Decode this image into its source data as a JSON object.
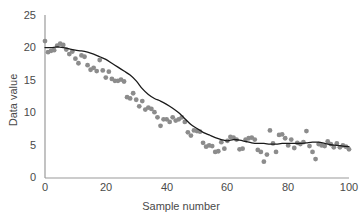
{
  "chart_data": {
    "type": "scatter",
    "title": "",
    "subtitle": "",
    "xlabel": "Sample number",
    "ylabel": "Data value",
    "xlim": [
      0,
      100
    ],
    "ylim": [
      0,
      25
    ],
    "xticks": [
      0,
      20,
      40,
      60,
      80,
      100
    ],
    "yticks": [
      0,
      5,
      10,
      15,
      20,
      25
    ],
    "grid": false,
    "legend": null,
    "colors": {
      "points": "#8c8c8c",
      "line": "#1a1a1a",
      "axis": "#9a9a9a",
      "text": "#4a4a4a",
      "background": "#ffffff"
    },
    "annotations": [],
    "series": [
      {
        "name": "Data value",
        "type": "scatter",
        "marker": "circle",
        "color": "#8c8c8c",
        "x": [
          0,
          1,
          2,
          3,
          4,
          5,
          6,
          7,
          8,
          9,
          10,
          11,
          12,
          13,
          14,
          15,
          16,
          17,
          18,
          19,
          20,
          21,
          22,
          23,
          24,
          25,
          26,
          27,
          28,
          29,
          30,
          31,
          32,
          33,
          34,
          35,
          36,
          37,
          38,
          39,
          40,
          41,
          42,
          43,
          44,
          45,
          46,
          47,
          48,
          49,
          50,
          51,
          52,
          53,
          54,
          55,
          56,
          57,
          58,
          59,
          60,
          61,
          62,
          63,
          64,
          65,
          66,
          67,
          68,
          69,
          70,
          71,
          72,
          73,
          74,
          75,
          76,
          77,
          78,
          79,
          80,
          81,
          82,
          83,
          84,
          85,
          86,
          87,
          88,
          89,
          90,
          91,
          92,
          93,
          94,
          95,
          96,
          97,
          98,
          99,
          100
        ],
        "y": [
          21.0,
          19.3,
          19.5,
          19.6,
          20.3,
          20.6,
          20.4,
          19.7,
          19.0,
          19.4,
          18.3,
          17.6,
          18.8,
          18.6,
          17.3,
          16.6,
          16.9,
          16.4,
          18.1,
          16.5,
          15.4,
          16.3,
          15.2,
          14.9,
          14.9,
          15.1,
          14.8,
          12.4,
          12.2,
          13.0,
          12.0,
          11.0,
          11.8,
          10.5,
          10.8,
          10.6,
          10.1,
          9.3,
          8.0,
          9.0,
          9.0,
          8.6,
          9.3,
          8.8,
          9.0,
          9.3,
          8.6,
          7.0,
          6.5,
          7.3,
          7.2,
          7.1,
          5.4,
          4.8,
          5.0,
          4.9,
          4.0,
          4.1,
          5.5,
          4.5,
          5.7,
          6.3,
          6.2,
          5.9,
          4.4,
          4.5,
          5.9,
          6.1,
          6.2,
          5.9,
          4.3,
          4.0,
          2.5,
          3.6,
          7.3,
          5.3,
          4.0,
          6.6,
          6.7,
          6.1,
          5.0,
          5.9,
          4.6,
          5.4,
          5.2,
          5.5,
          7.2,
          4.9,
          4.0,
          2.9,
          5.2,
          5.0,
          4.9,
          5.6,
          5.2,
          4.7,
          5.3,
          4.7,
          5.0,
          4.8,
          4.4
        ]
      },
      {
        "name": "Smoothed trend",
        "type": "line",
        "color": "#1a1a1a",
        "x": [
          0,
          2,
          4,
          6,
          8,
          10,
          12,
          14,
          16,
          18,
          20,
          22,
          24,
          26,
          28,
          30,
          32,
          34,
          36,
          38,
          40,
          42,
          44,
          46,
          48,
          50,
          52,
          54,
          56,
          58,
          60,
          62,
          64,
          66,
          68,
          70,
          72,
          74,
          76,
          78,
          80,
          82,
          84,
          86,
          88,
          90,
          92,
          94,
          96,
          98,
          100
        ],
        "y": [
          20.0,
          20.0,
          20.1,
          20.0,
          19.8,
          19.6,
          19.5,
          19.3,
          19.0,
          18.6,
          18.2,
          17.6,
          17.0,
          16.4,
          15.8,
          14.9,
          13.7,
          12.8,
          12.2,
          11.8,
          11.3,
          10.7,
          10.0,
          9.1,
          8.2,
          7.6,
          7.0,
          6.6,
          6.2,
          5.9,
          5.7,
          5.9,
          5.8,
          5.6,
          5.4,
          5.3,
          5.3,
          5.2,
          5.2,
          5.3,
          5.3,
          5.3,
          5.3,
          5.4,
          5.5,
          5.5,
          5.3,
          5.1,
          5.0,
          4.9,
          4.8
        ]
      }
    ]
  },
  "axes": {
    "y_tick_labels": [
      "25",
      "20",
      "15",
      "10",
      "5",
      "0"
    ],
    "x_tick_labels": [
      "0",
      "20",
      "40",
      "60",
      "80",
      "100"
    ],
    "x_title": "Sample number",
    "y_title": "Data value"
  }
}
